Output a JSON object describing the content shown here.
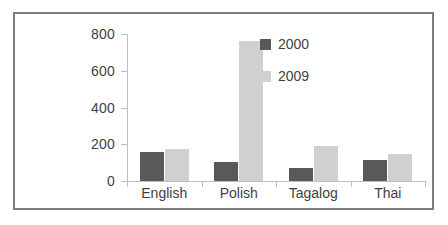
{
  "chart_data": {
    "type": "bar",
    "title": "",
    "xlabel": "",
    "ylabel": "",
    "categories": [
      "English",
      "Polish",
      "Tagalog",
      "Thai"
    ],
    "series": [
      {
        "name": "2000",
        "color": "#595959",
        "values": [
          160,
          105,
          70,
          115
        ]
      },
      {
        "name": "2009",
        "color": "#d0d0d0",
        "values": [
          175,
          760,
          190,
          145
        ]
      }
    ],
    "ylim": [
      0,
      800
    ],
    "yticks": [
      0,
      200,
      400,
      600,
      800
    ],
    "ytick_labels": [
      "0",
      "200",
      "400",
      "600",
      "800"
    ],
    "grid": false,
    "legend_position": "top-right",
    "axis_color": "#bfbfbf",
    "text_color": "#3f3f3f",
    "frame_color": "#7d7d7d",
    "background": "#ffffff"
  }
}
